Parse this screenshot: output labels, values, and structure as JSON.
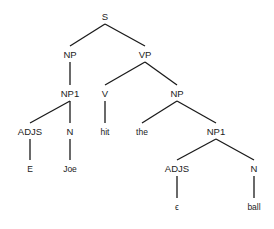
{
  "diagram": {
    "type": "parse-tree",
    "nodes": [
      {
        "id": "S",
        "label": "S",
        "x": 105,
        "y": 20,
        "kind": "nonterminal"
      },
      {
        "id": "NP_a",
        "label": "NP",
        "x": 70,
        "y": 58,
        "kind": "nonterminal"
      },
      {
        "id": "VP",
        "label": "VP",
        "x": 145,
        "y": 58,
        "kind": "nonterminal"
      },
      {
        "id": "NP1_a",
        "label": "NP1",
        "x": 70,
        "y": 97,
        "kind": "nonterminal"
      },
      {
        "id": "V",
        "label": "V",
        "x": 105,
        "y": 97,
        "kind": "nonterminal"
      },
      {
        "id": "NP_b",
        "label": "NP",
        "x": 177,
        "y": 97,
        "kind": "nonterminal"
      },
      {
        "id": "ADJS_a",
        "label": "ADJS",
        "x": 30,
        "y": 135,
        "kind": "nonterminal"
      },
      {
        "id": "N_a",
        "label": "N",
        "x": 70,
        "y": 135,
        "kind": "nonterminal"
      },
      {
        "id": "hit",
        "label": "hit",
        "x": 105,
        "y": 135,
        "kind": "terminal"
      },
      {
        "id": "the",
        "label": "the",
        "x": 142,
        "y": 135,
        "kind": "terminal"
      },
      {
        "id": "NP1_b",
        "label": "NP1",
        "x": 216,
        "y": 135,
        "kind": "nonterminal"
      },
      {
        "id": "E",
        "label": "E",
        "x": 30,
        "y": 172,
        "kind": "terminal"
      },
      {
        "id": "Joe",
        "label": "Joe",
        "x": 70,
        "y": 172,
        "kind": "terminal"
      },
      {
        "id": "ADJS_b",
        "label": "ADJS",
        "x": 177,
        "y": 172,
        "kind": "nonterminal"
      },
      {
        "id": "N_b",
        "label": "N",
        "x": 254,
        "y": 172,
        "kind": "nonterminal"
      },
      {
        "id": "eps",
        "label": "ϵ",
        "x": 177,
        "y": 210,
        "kind": "terminal"
      },
      {
        "id": "ball",
        "label": "ball",
        "x": 254,
        "y": 210,
        "kind": "terminal"
      }
    ],
    "edges": [
      {
        "from": "S",
        "to": "NP_a"
      },
      {
        "from": "S",
        "to": "VP"
      },
      {
        "from": "NP_a",
        "to": "NP1_a"
      },
      {
        "from": "VP",
        "to": "V"
      },
      {
        "from": "VP",
        "to": "NP_b"
      },
      {
        "from": "NP1_a",
        "to": "ADJS_a"
      },
      {
        "from": "NP1_a",
        "to": "N_a"
      },
      {
        "from": "V",
        "to": "hit"
      },
      {
        "from": "NP_b",
        "to": "the"
      },
      {
        "from": "NP_b",
        "to": "NP1_b"
      },
      {
        "from": "ADJS_a",
        "to": "E"
      },
      {
        "from": "N_a",
        "to": "Joe"
      },
      {
        "from": "NP1_b",
        "to": "ADJS_b"
      },
      {
        "from": "NP1_b",
        "to": "N_b"
      },
      {
        "from": "ADJS_b",
        "to": "eps"
      },
      {
        "from": "N_b",
        "to": "ball"
      }
    ],
    "colors": {
      "background": "#ffffff",
      "line": "#1a1a1a",
      "text": "#222222"
    }
  }
}
